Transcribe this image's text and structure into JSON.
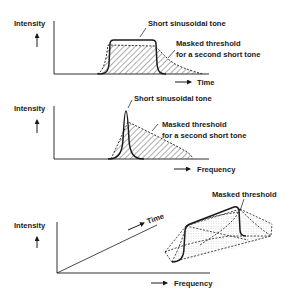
{
  "panels": [
    {
      "id": "time-domain",
      "ylabel": "Intensity",
      "xlabel": "Time",
      "annotations": {
        "tone": "Short sinusoidal tone",
        "masked_line1": "Masked threshold",
        "masked_line2": "for a second short tone"
      }
    },
    {
      "id": "frequency-domain",
      "ylabel": "Intensity",
      "xlabel": "Frequency",
      "annotations": {
        "tone": "Short sinusoidal tone",
        "masked_line1": "Masked threshold",
        "masked_line2": "for a second short tone"
      }
    },
    {
      "id": "time-frequency",
      "ylabel": "Intensity",
      "xlabel": "Frequency",
      "zlabel": "Time",
      "annotations": {
        "masked": "Masked threshold"
      }
    }
  ],
  "colors": {
    "ink": "#1a1a1a",
    "background": "#ffffff"
  }
}
